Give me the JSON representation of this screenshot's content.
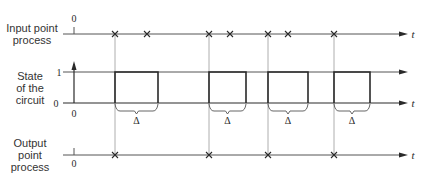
{
  "labels": {
    "input": "Input point\nprocess",
    "input_line1": "Input point",
    "input_line2": "process",
    "state_line1": "State",
    "state_line2": "of the",
    "state_line3": "circuit",
    "output_line1": "Output",
    "output_line2": "point",
    "output_line3": "process",
    "zero": "0",
    "one": "1",
    "time": "t",
    "delta": "Δ"
  },
  "axes": {
    "input_y": 34,
    "state_high_y": 72,
    "state_base_y": 103,
    "output_y": 155,
    "x_start": 63,
    "x_origin": 74,
    "x_end": 408
  },
  "input_points": [
    115,
    147,
    209,
    230,
    268,
    288,
    334
  ],
  "output_points": [
    115,
    209,
    268,
    334
  ],
  "pulses": [
    {
      "start": 115,
      "end": 158
    },
    {
      "start": 209,
      "end": 246
    },
    {
      "start": 268,
      "end": 308
    },
    {
      "start": 334,
      "end": 370
    }
  ],
  "colors": {
    "ink": "#2a2a2a",
    "thin": "#555555",
    "guide": "#9a9a9a"
  }
}
